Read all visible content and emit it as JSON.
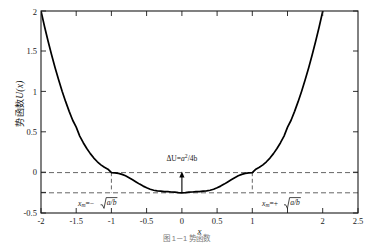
{
  "chart_data": {
    "type": "line",
    "title": "",
    "xlabel": "x",
    "ylabel": "势函数 U(x)",
    "xlim": [
      -2,
      2.5
    ],
    "ylim": [
      -0.5,
      2
    ],
    "grid": false,
    "legend": null,
    "xticks": [
      -2,
      -1.5,
      -1,
      -0.5,
      0,
      0.5,
      1,
      1.5,
      2,
      2.5
    ],
    "xticklabels": [
      "-2",
      "-1.5",
      "-1",
      "-0.5",
      "0",
      "0.5",
      "1",
      "",
      "2",
      "2.5"
    ],
    "yticks": [
      -0.5,
      -0.25,
      0,
      0.5,
      1,
      1.5,
      2
    ],
    "yticklabels": [
      "-0.5",
      "",
      "0",
      "0.5",
      "1",
      "1.5",
      "2"
    ],
    "series": [
      {
        "name": "U(x)",
        "color": "#000000",
        "x": [
          -2.0,
          -1.95,
          -1.9,
          -1.85,
          -1.8,
          -1.75,
          -1.7,
          -1.65,
          -1.6,
          -1.55,
          -1.5,
          -1.45,
          -1.4,
          -1.35,
          -1.3,
          -1.25,
          -1.2,
          -1.15,
          -1.1,
          -1.05,
          -1.0,
          -0.95,
          -0.9,
          -0.85,
          -0.8,
          -0.75,
          -0.7,
          -0.65,
          -0.6,
          -0.55,
          -0.5,
          -0.45,
          -0.4,
          -0.35,
          -0.3,
          -0.25,
          -0.2,
          -0.15,
          -0.1,
          -0.05,
          0.0,
          0.05,
          0.1,
          0.15,
          0.2,
          0.25,
          0.3,
          0.35,
          0.4,
          0.45,
          0.5,
          0.55,
          0.6,
          0.65,
          0.7,
          0.75,
          0.8,
          0.85,
          0.9,
          0.95,
          1.0,
          1.05,
          1.1,
          1.15,
          1.2,
          1.25,
          1.3,
          1.35,
          1.4,
          1.45,
          1.5,
          1.55,
          1.6,
          1.65,
          1.7,
          1.75,
          1.8,
          1.85,
          1.9,
          1.95,
          2.0,
          2.05,
          2.1,
          2.15,
          2.2,
          2.25,
          2.3,
          2.35,
          2.4,
          2.45,
          2.5
        ],
        "y": [
          2.0,
          1.808,
          1.628,
          1.458,
          1.298,
          1.148,
          1.008,
          0.878,
          0.758,
          0.648,
          0.5625,
          0.452,
          0.37,
          0.298,
          0.235,
          0.18,
          0.134,
          0.096,
          0.066,
          0.043,
          0.0,
          -0.0024,
          -0.0099,
          -0.0216,
          -0.0396,
          -0.0625,
          -0.0884,
          -0.1156,
          -0.1424,
          -0.1672,
          -0.1875,
          -0.2064,
          -0.2184,
          -0.2256,
          -0.2299,
          -0.2344,
          -0.2356,
          -0.24,
          -0.2425,
          -0.2475,
          -0.25,
          -0.2475,
          -0.2425,
          -0.24,
          -0.2356,
          -0.2344,
          -0.2299,
          -0.2256,
          -0.2184,
          -0.2064,
          -0.1875,
          -0.1672,
          -0.1424,
          -0.1156,
          -0.0884,
          -0.0625,
          -0.0396,
          -0.0216,
          -0.0099,
          -0.0024,
          0.0,
          0.043,
          0.066,
          0.096,
          0.134,
          0.18,
          0.235,
          0.298,
          0.37,
          0.452,
          0.5625,
          0.648,
          0.758,
          0.878,
          1.008,
          1.148,
          1.298,
          1.458,
          1.628,
          1.808,
          2.0,
          2.2,
          2.41,
          2.63,
          2.86,
          3.1,
          3.35,
          3.61,
          3.88,
          4.16,
          4.45
        ]
      }
    ],
    "reference_lines": {
      "horizontal": [
        {
          "y": 0,
          "style": "dashed",
          "color": "#555555",
          "x_from": -2,
          "x_to": 2.5
        },
        {
          "y": -0.25,
          "style": "dashed",
          "color": "#555555",
          "x_from": -2,
          "x_to": 2.5
        }
      ],
      "vertical": [
        {
          "x": -1,
          "style": "dashed",
          "color": "#555555",
          "y_from": -0.25,
          "y_to": 0
        },
        {
          "x": 1,
          "style": "dashed",
          "color": "#555555",
          "y_from": -0.25,
          "y_to": 0
        }
      ]
    },
    "annotations": [
      {
        "name": "barrier-height",
        "text": "ΔU=a²/4b",
        "x": 0,
        "y": 0.08,
        "arrow": {
          "from_x": 0,
          "from_y": -0.25,
          "to_x": 0,
          "to_y": 0.0
        }
      },
      {
        "name": "left-minimum",
        "text": "x_m=-√(a/b)",
        "x": -1,
        "y": -0.36
      },
      {
        "name": "right-minimum",
        "text": "x_m=+√(a/b)",
        "x": 1,
        "y": -0.36
      }
    ],
    "minima": [
      {
        "x": -1,
        "y": -0.25
      },
      {
        "x": 1,
        "y": -0.25
      }
    ],
    "local_maximum": {
      "x": 0,
      "y": 0
    }
  },
  "labels": {
    "y_axis_cn": "势函数",
    "y_axis_fn": "U",
    "y_axis_arg": "(x)",
    "x_axis": "x",
    "annot_barrier_head": "ΔU=",
    "annot_barrier_num": "a",
    "annot_barrier_exp": "2",
    "annot_barrier_den": "/4b",
    "annot_left_var": "x",
    "annot_left_sub": "m",
    "annot_left_eq": "=−",
    "annot_right_var": "x",
    "annot_right_sub": "m",
    "annot_right_eq": "=+",
    "annot_radicand": "a/b"
  },
  "caption": {
    "text": "图 1－1  势函数"
  },
  "colors": {
    "curve": "#000000",
    "axis": "#1a1a1a",
    "dashed": "#555555",
    "background": "#ffffff",
    "text": "#1a1a1a"
  }
}
